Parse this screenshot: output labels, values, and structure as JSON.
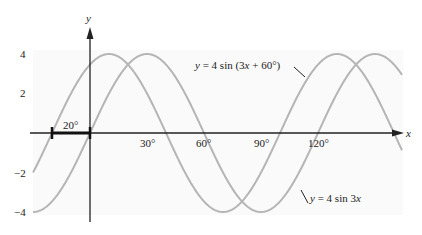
{
  "chart_data": {
    "type": "line",
    "title": "",
    "xlabel": "x",
    "ylabel": "y",
    "x_unit": "degrees",
    "xlim": [
      -48,
      165
    ],
    "ylim": [
      -4.5,
      4.5
    ],
    "x_ticks": [
      "30°",
      "60°",
      "90°",
      "120°"
    ],
    "y_ticks": [
      "4",
      "2",
      "−2",
      "−4"
    ],
    "grid": false,
    "series": [
      {
        "name": "y = 4 sin 3x",
        "amplitude": 4,
        "frequency": 3,
        "phase_deg": 0,
        "label": "y = 4 sin 3x"
      },
      {
        "name": "y = 4 sin (3x + 60°)",
        "amplitude": 4,
        "frequency": 3,
        "phase_deg": 60,
        "label": "y = 4 sin (3x + 60°)"
      }
    ],
    "annotations": [
      {
        "type": "interval",
        "from": -20,
        "to": 0,
        "label": "20°"
      }
    ],
    "colors": {
      "curve": "#b5b5b5",
      "axis": "#222222",
      "interval": "#111111"
    }
  },
  "labels": {
    "x_axis": "x",
    "y_axis": "y",
    "tick_30": "30°",
    "tick_60": "60°",
    "tick_90": "90°",
    "tick_120": "120°",
    "ytick_4": "4",
    "ytick_2": "2",
    "ytick_m2": "−2",
    "ytick_m4": "−4",
    "shift": "20°",
    "curve1_label": "y = 4 sin (3x + 60°)",
    "curve2_label": "y = 4 sin 3x"
  }
}
